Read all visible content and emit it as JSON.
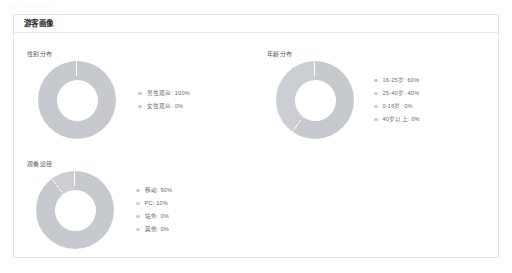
{
  "top_artifacts": [
    "— ——  —— — —"
  ],
  "card": {
    "title": "游客画像"
  },
  "colors": {
    "segment_gray": "#c6c9cd",
    "segment_gray_alt": "#cbced2",
    "divider": "#ffffff",
    "legend_dot": "#c9ccd0",
    "card_border": "#e2e4e7",
    "text_primary": "#2f2f2f",
    "text_secondary": "#5a5a5a",
    "text_legend": "#6b6b6b"
  },
  "chart_data": [
    {
      "type": "pie",
      "id": "gender-distribution",
      "title": "性别分布",
      "donut": true,
      "legend_position": "right",
      "categories": [
        "男性观众",
        "女性观众"
      ],
      "values": [
        100,
        0
      ],
      "unit": "%",
      "legend": [
        {
          "label": "男性观众: 100%",
          "value": 100,
          "color": "#c6c9cd"
        },
        {
          "label": "女性观众: 0%",
          "value": 0,
          "color": "#c9ccd0"
        }
      ]
    },
    {
      "type": "pie",
      "id": "age-distribution",
      "title": "年龄分布",
      "donut": true,
      "legend_position": "right",
      "categories": [
        "16-25岁",
        "25-40岁",
        "0-16岁",
        "40岁以上"
      ],
      "values": [
        60,
        40,
        0,
        0
      ],
      "unit": "%",
      "legend": [
        {
          "label": "16-25岁: 60%",
          "value": 60,
          "color": "#c6c9cd"
        },
        {
          "label": "25-40岁: 40%",
          "value": 40,
          "color": "#cbced2"
        },
        {
          "label": "0-16岁: 0%",
          "value": 0,
          "color": "#c9ccd0"
        },
        {
          "label": "40岁以上: 0%",
          "value": 0,
          "color": "#c9ccd0"
        }
      ]
    },
    {
      "type": "pie",
      "id": "viewing-channel",
      "title": "观看途径",
      "donut": true,
      "legend_position": "right",
      "categories": [
        "移动",
        "PC",
        "站外",
        "其他"
      ],
      "values": [
        90,
        10,
        0,
        0
      ],
      "unit": "%",
      "legend": [
        {
          "label": "移动: 90%",
          "value": 90,
          "color": "#c6c9cd"
        },
        {
          "label": "PC: 10%",
          "value": 10,
          "color": "#cbced2"
        },
        {
          "label": "站外: 0%",
          "value": 0,
          "color": "#c9ccd0"
        },
        {
          "label": "其他: 0%",
          "value": 0,
          "color": "#c9ccd0"
        }
      ]
    }
  ]
}
